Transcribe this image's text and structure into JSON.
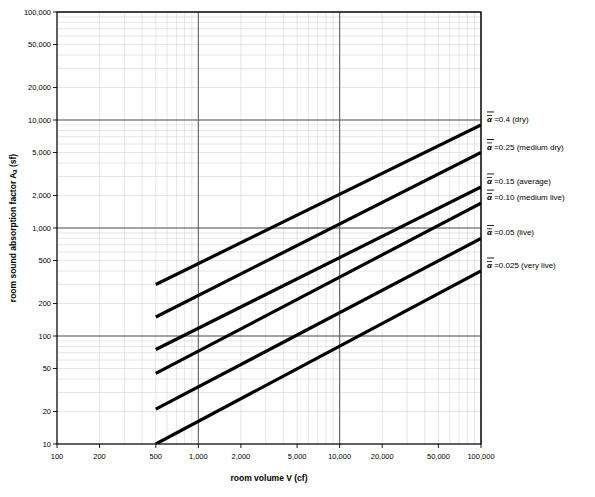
{
  "chart_data": {
    "type": "line",
    "title": "",
    "xlabel": "room volume V (cf)",
    "ylabel": "room sound absorption factor Aₐ (sf)",
    "xscale": "log",
    "yscale": "log",
    "xlim": [
      100,
      100000
    ],
    "ylim": [
      10,
      100000
    ],
    "grid": true,
    "legend_position": "right-of-plot",
    "xticks": [
      "100",
      "200",
      "500",
      "1,000",
      "2,000",
      "5,000",
      "10,000",
      "20,000",
      "50,000",
      "100,000"
    ],
    "xtick_values": [
      100,
      200,
      500,
      1000,
      2000,
      5000,
      10000,
      20000,
      50000,
      100000
    ],
    "yticks": [
      "10",
      "20",
      "50",
      "100",
      "200",
      "500",
      "1,000",
      "2,000",
      "5,000",
      "10,000",
      "20,000",
      "50,000",
      "100,000"
    ],
    "ytick_values": [
      10,
      20,
      50,
      100,
      200,
      500,
      1000,
      2000,
      5000,
      10000,
      20000,
      50000,
      100000
    ],
    "series": [
      {
        "name": "alpha-0.4-dry",
        "label_alpha": "α",
        "label_text": " =0.4 (dry)",
        "alpha": 0.4,
        "x": [
          500,
          100000
        ],
        "y": [
          300,
          9000
        ]
      },
      {
        "name": "alpha-0.25-medium-dry",
        "label_alpha": "α",
        "label_text": " =0.25 (medium dry)",
        "alpha": 0.25,
        "x": [
          500,
          100000
        ],
        "y": [
          150,
          5000
        ]
      },
      {
        "name": "alpha-0.15-average",
        "label_alpha": "α",
        "label_text": " =0.15 (average)",
        "alpha": 0.15,
        "x": [
          500,
          100000
        ],
        "y": [
          75,
          2400
        ]
      },
      {
        "name": "alpha-0.10-medium-live",
        "label_alpha": "α",
        "label_text": " =0.10 (medium live)",
        "alpha": 0.1,
        "x": [
          500,
          100000
        ],
        "y": [
          45,
          1700
        ]
      },
      {
        "name": "alpha-0.05-live",
        "label_alpha": "α",
        "label_text": " =0.05 (live)",
        "alpha": 0.05,
        "x": [
          500,
          100000
        ],
        "y": [
          21,
          800
        ]
      },
      {
        "name": "alpha-0.025-very-live",
        "label_alpha": "α",
        "label_text": " =0.025 (very live)",
        "alpha": 0.025,
        "x": [
          500,
          100000
        ],
        "y": [
          10,
          400
        ]
      }
    ]
  }
}
